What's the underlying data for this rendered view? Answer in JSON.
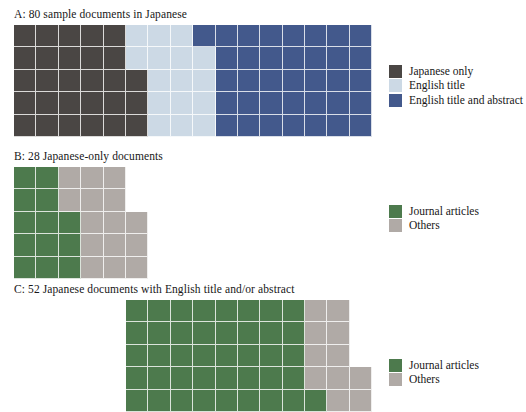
{
  "figure": {
    "type": "waffle-chart-figure",
    "background": "#ffffff"
  },
  "colors": {
    "japanese_only": "#4a4644",
    "english_title": "#ccd9e5",
    "english_title_and_abstract": "#43598c",
    "journal_articles": "#4d7a4d",
    "others": "#b0aaa6",
    "cell_gap": "#ffffff"
  },
  "panels": [
    {
      "id": "A",
      "title": "A: 80 sample documents in Japanese",
      "total": 80,
      "columns": 16,
      "rows": 5,
      "cell_size": 22.4,
      "fill_order": "column-major-bottom-up",
      "legend": {
        "items": [
          {
            "label": "Japanese only",
            "color": "#4a4644",
            "count": 28
          },
          {
            "label": "English title",
            "color": "#ccd9e5",
            "count": 16
          },
          {
            "label": "English title and abstract",
            "color": "#43598c",
            "count": 36
          }
        ]
      },
      "column_counts": [
        {
          "color": "#4a4644",
          "cells": 28
        },
        {
          "color": "#ccd9e5",
          "cells": 16
        },
        {
          "color": "#43598c",
          "cells": 36
        }
      ]
    },
    {
      "id": "B",
      "title": "B: 28 Japanese-only documents",
      "total": 28,
      "columns": 6,
      "rows": 5,
      "cell_size": 22.4,
      "fill_order": "column-major-bottom-up",
      "legend": {
        "items": [
          {
            "label": "Journal articles",
            "color": "#4d7a4d",
            "count": 13
          },
          {
            "label": "Others",
            "color": "#b0aaa6",
            "count": 15
          }
        ]
      },
      "column_counts": [
        {
          "color": "#4d7a4d",
          "cells": 13
        },
        {
          "color": "#b0aaa6",
          "cells": 15
        }
      ]
    },
    {
      "id": "C",
      "title": "C: 52 Japanese documents with English title and/or abstract",
      "total": 52,
      "columns": 11,
      "rows": 5,
      "cell_size": 22.4,
      "offset_columns": 5,
      "fill_order": "column-major-bottom-up",
      "legend": {
        "items": [
          {
            "label": "Journal articles",
            "color": "#4d7a4d",
            "count": 41
          },
          {
            "label": "Others",
            "color": "#b0aaa6",
            "count": 11
          }
        ]
      },
      "column_counts": [
        {
          "color": "#4d7a4d",
          "cells": 41
        },
        {
          "color": "#b0aaa6",
          "cells": 11
        }
      ]
    }
  ],
  "chart_data": {
    "type": "bar",
    "chart_style": "waffle / square-pie",
    "title": "",
    "xlabel": "",
    "ylabel": "",
    "panels": [
      {
        "panel": "A",
        "title": "A: 80 sample documents in Japanese",
        "categories": [
          "Japanese only",
          "English title",
          "English title and abstract"
        ],
        "values": [
          28,
          16,
          36
        ],
        "unit": "documents",
        "total": 80,
        "percentages": [
          35.0,
          20.0,
          45.0
        ],
        "colors": [
          "#4a4644",
          "#ccd9e5",
          "#43598c"
        ],
        "grid": true,
        "legend_position": "right"
      },
      {
        "panel": "B",
        "title": "B: 28 Japanese-only documents",
        "categories": [
          "Journal articles",
          "Others"
        ],
        "values": [
          13,
          15
        ],
        "unit": "documents",
        "total": 28,
        "percentages": [
          46.4,
          53.6
        ],
        "colors": [
          "#4d7a4d",
          "#b0aaa6"
        ],
        "grid": true,
        "legend_position": "right"
      },
      {
        "panel": "C",
        "title": "C: 52 Japanese documents with English title and/or abstract",
        "categories": [
          "Journal articles",
          "Others"
        ],
        "values": [
          41,
          11
        ],
        "unit": "documents",
        "total": 52,
        "percentages": [
          78.8,
          21.2
        ],
        "colors": [
          "#4d7a4d",
          "#b0aaa6"
        ],
        "grid": true,
        "legend_position": "right"
      }
    ]
  }
}
